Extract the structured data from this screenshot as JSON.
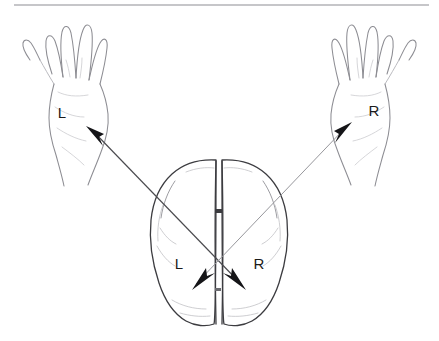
{
  "figure": {
    "background_color": "#ffffff",
    "ink_color": "#1a1a1a",
    "rule_color": "#8e8e93"
  },
  "rule": {
    "present": true,
    "x_start": 14,
    "x_end": 429,
    "y": 5
  },
  "labels": {
    "left_hand": "L",
    "right_hand": "R",
    "left_hemisphere": "L",
    "right_hemisphere": "R"
  },
  "hands": [
    {
      "name": "left-hand",
      "side": "left",
      "label": "L",
      "orientation": "palm-up, fingers splayed, thumb on outer left",
      "label_x": 62,
      "label_y": 118
    },
    {
      "name": "right-hand",
      "side": "right",
      "label": "R",
      "orientation": "palm-up, fingers splayed, thumb on outer right",
      "label_x": 372,
      "label_y": 116
    }
  ],
  "brain": {
    "name": "brain-top-view",
    "view": "axial / superior view",
    "center_x": 219,
    "top_y": 159,
    "bottom_y": 326,
    "left_x": 151,
    "right_x": 289,
    "midline_label": "longitudinal fissure",
    "hemispheres": [
      {
        "name": "left-hemisphere",
        "label": "L",
        "label_x": 175,
        "label_y": 268
      },
      {
        "name": "right-hemisphere",
        "label": "R",
        "label_x": 253,
        "label_y": 268
      }
    ]
  },
  "pathways": [
    {
      "name": "right-hemisphere-to-left-hand",
      "from": "right hemisphere",
      "to": "left hand",
      "start_x": 241,
      "start_y": 284,
      "end_x": 86,
      "end_y": 126,
      "emphasis": "dark"
    },
    {
      "name": "left-hemisphere-to-right-hand",
      "from": "left hemisphere",
      "to": "right hand",
      "start_x": 196,
      "start_y": 284,
      "end_x": 351,
      "end_y": 123,
      "emphasis": "light"
    }
  ],
  "crossing": {
    "name": "decussation-point",
    "x": 219,
    "y": 259,
    "description": "pathways cross at the midline"
  }
}
